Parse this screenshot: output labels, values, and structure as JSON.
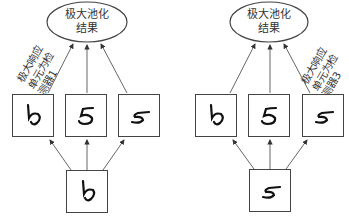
{
  "diagram": {
    "type": "max-pooling-illustration",
    "panels": [
      {
        "id": "left",
        "pool_node_label_line1": "极大池化",
        "pool_node_label_line2": "结果",
        "annotation_line1": "极大响应",
        "annotation_line2": "单元为检",
        "annotation_line3": "测器1",
        "detectors": [
          {
            "name": "detector-1",
            "digit": "rotated-5 (ϟ-like)"
          },
          {
            "name": "detector-2",
            "digit": "5"
          },
          {
            "name": "detector-3",
            "digit": "5 (tilted right)"
          }
        ],
        "input": {
          "digit": "rotated-5 (ϟ-like)"
        }
      },
      {
        "id": "right",
        "pool_node_label_line1": "极大池化",
        "pool_node_label_line2": "结果",
        "annotation_line1": "极大响应",
        "annotation_line2": "单元为检",
        "annotation_line3": "测器3",
        "detectors": [
          {
            "name": "detector-1",
            "digit": "rotated-5 (ϟ-like)"
          },
          {
            "name": "detector-2",
            "digit": "5"
          },
          {
            "name": "detector-3",
            "digit": "5 (tilted right)"
          }
        ],
        "input": {
          "digit": "5 (tilted right)"
        }
      }
    ],
    "colors": {
      "stroke": "#444444",
      "text": "#333333",
      "background": "#ffffff"
    }
  }
}
